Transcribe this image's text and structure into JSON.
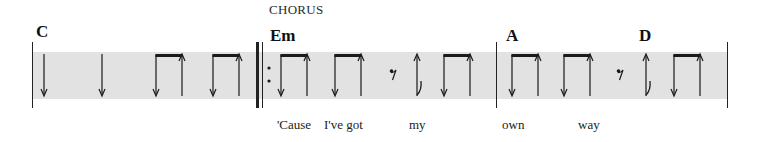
{
  "section": {
    "label": "CHORUS"
  },
  "colors": {
    "staff_band": "#e2e2e2",
    "ink": "#1a1a1a",
    "background": "#ffffff"
  },
  "measures": [
    {
      "chords": [
        {
          "symbol": "C",
          "x": 36
        }
      ],
      "strokes": [
        {
          "type": "down-quarter",
          "x": 44
        },
        {
          "type": "down-quarter",
          "x": 102
        },
        {
          "type": "beamed-down-up",
          "x1": 156,
          "x2": 182
        },
        {
          "type": "beamed-down-up",
          "x1": 213,
          "x2": 239
        }
      ]
    },
    {
      "repeat_start": true,
      "chords": [
        {
          "symbol": "Em",
          "x": 270
        }
      ],
      "strokes": [
        {
          "type": "beamed-down-up",
          "x1": 281,
          "x2": 308
        },
        {
          "type": "beamed-down-up",
          "x1": 335,
          "x2": 361
        },
        {
          "type": "eighth-rest",
          "x": 393
        },
        {
          "type": "up-eighth",
          "x": 417
        },
        {
          "type": "beamed-down-up",
          "x1": 444,
          "x2": 470
        }
      ]
    },
    {
      "chords": [
        {
          "symbol": "A",
          "x": 506
        },
        {
          "symbol": "D",
          "x": 639
        }
      ],
      "strokes": [
        {
          "type": "beamed-down-up",
          "x1": 512,
          "x2": 538
        },
        {
          "type": "beamed-down-up",
          "x1": 564,
          "x2": 590
        },
        {
          "type": "eighth-rest",
          "x": 620
        },
        {
          "type": "up-eighth",
          "x": 646
        },
        {
          "type": "beamed-down-up",
          "x1": 674,
          "x2": 701
        }
      ]
    }
  ],
  "chords": {
    "c1": "C",
    "c2": "Em",
    "c3": "A",
    "c4": "D"
  },
  "lyrics": {
    "w1": "'Cause",
    "w2": "I've got",
    "w3": "my",
    "w4": "own",
    "w5": "way"
  }
}
